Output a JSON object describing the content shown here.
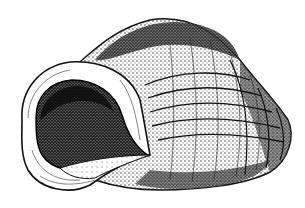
{
  "image": {
    "subject": "snail shell illustration",
    "style": "black ink stipple drawing on white",
    "background_color": "#ffffff",
    "ink_color": "#111111"
  }
}
